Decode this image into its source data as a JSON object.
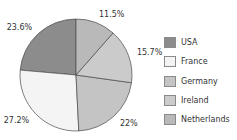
{
  "chart_data": {
    "type": "pie",
    "title": "",
    "categories": [
      "USA",
      "France",
      "Germany",
      "Ireland",
      "Netherlands"
    ],
    "values": [
      23.6,
      27.2,
      22,
      15.7,
      11.5
    ],
    "labels": [
      "23.6%",
      "27.2%",
      "22%",
      "15.7%",
      "11.5%"
    ],
    "colors": [
      "#8c8c8c",
      "#f4f4f4",
      "#c4c4c4",
      "#cbcbcb",
      "#b9b9b9"
    ],
    "start_angle_deg": 0,
    "direction": "counterclockwise",
    "legend_position": "right"
  },
  "legend": {
    "items": [
      {
        "label": "USA",
        "color": "#8c8c8c"
      },
      {
        "label": "France",
        "color": "#f4f4f4"
      },
      {
        "label": "Germany",
        "color": "#c4c4c4"
      },
      {
        "label": "Ireland",
        "color": "#cbcbcb"
      },
      {
        "label": "Netherlands",
        "color": "#b9b9b9"
      }
    ]
  }
}
